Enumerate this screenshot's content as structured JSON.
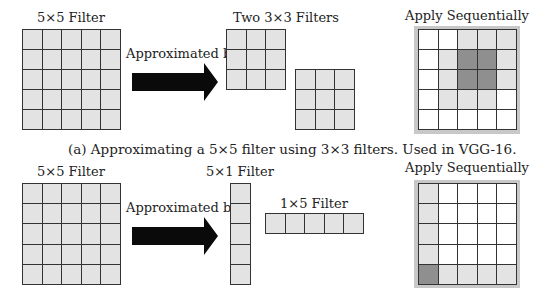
{
  "colors": {
    "light": "#e3e3e3",
    "white": "#ffffff",
    "dark": "#8f8f8f",
    "frame": "#c8c8c8",
    "arrow": "#0a0a0a"
  },
  "panel_a": {
    "filter_label": "5×5 Filter",
    "arrow_label": "Approximated by",
    "small_filters_label": "Two 3×3 Filters",
    "result_label": "Apply Sequentially",
    "caption": "(a) Approximating a 5×5 filter using 3×3 filters. Used in VGG-16.",
    "result_grid": [
      [
        "W",
        "W",
        "L",
        "L",
        "L"
      ],
      [
        "W",
        "L",
        "D",
        "D",
        "L"
      ],
      [
        "W",
        "L",
        "D",
        "D",
        "L"
      ],
      [
        "W",
        "L",
        "L",
        "L",
        "W"
      ],
      [
        "W",
        "W",
        "W",
        "W",
        "W"
      ]
    ]
  },
  "panel_b": {
    "filter_label": "5×5 Filter",
    "arrow_label": "Approximated by",
    "col_filter_label": "5×1 Filter",
    "row_filter_label": "1×5 Filter",
    "result_label": "Apply Sequentially",
    "result_grid": [
      [
        "L",
        "W",
        "W",
        "W",
        "W"
      ],
      [
        "L",
        "W",
        "W",
        "W",
        "W"
      ],
      [
        "L",
        "W",
        "W",
        "W",
        "W"
      ],
      [
        "L",
        "W",
        "W",
        "W",
        "W"
      ],
      [
        "D",
        "L",
        "L",
        "L",
        "L"
      ]
    ]
  }
}
